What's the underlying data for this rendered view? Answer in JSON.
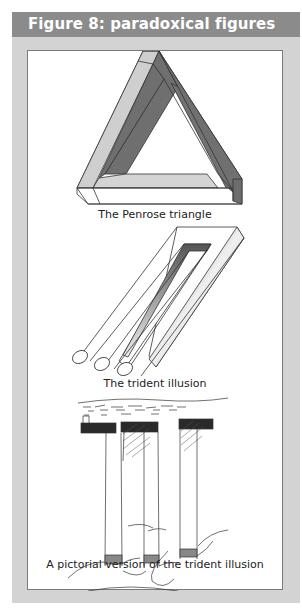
{
  "header": {
    "title": "Figure 8: paradoxical figures"
  },
  "figures": [
    {
      "caption": "The Penrose triangle",
      "icon": "penrose-triangle"
    },
    {
      "caption": "The trident illusion",
      "icon": "impossible-trident"
    },
    {
      "caption": "A pictorial version of the trident illusion",
      "icon": "pictorial-trident-pillars"
    }
  ],
  "colors": {
    "header_bg": "#8b8b8b",
    "header_text": "#ffffff",
    "panel_bg": "#d3d3d3",
    "inner_bg": "#ffffff",
    "inner_border": "#7a7a7a",
    "shade_dark": "#6f6f6f",
    "shade_light": "#cfcfcf"
  }
}
